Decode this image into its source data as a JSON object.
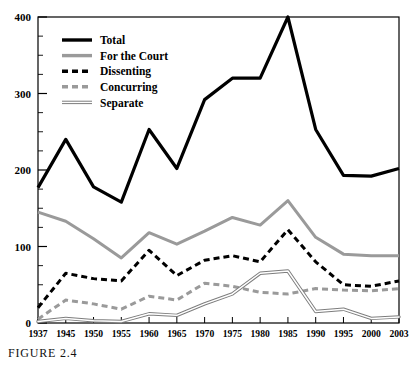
{
  "caption": "FIGURE 2.4",
  "legend": {
    "position": "top-left-inside",
    "entries": [
      {
        "label": "Total",
        "style": "solid-thick-black",
        "color": "#000000"
      },
      {
        "label": "For the Court",
        "style": "solid-thick-gray",
        "color": "#9a9a9a"
      },
      {
        "label": "Dissenting",
        "style": "dashed-thick-black",
        "color": "#000000"
      },
      {
        "label": "Concurring",
        "style": "dashed-thick-gray",
        "color": "#9a9a9a"
      },
      {
        "label": "Separate",
        "style": "double-thin-gray",
        "color": "#7d7d7d"
      }
    ]
  },
  "axes": {
    "y_tick_labels": [
      "400",
      "300",
      "200",
      "100",
      "0"
    ],
    "y_tick_values": [
      400,
      300,
      200,
      100,
      0
    ],
    "y_minor_step": 25,
    "x_tick_labels": [
      "1937",
      "1945",
      "1950",
      "1955",
      "1960",
      "1965",
      "1970",
      "1975",
      "1980",
      "1985",
      "1990",
      "1995",
      "2000",
      "2003"
    ]
  },
  "chart_data": {
    "type": "line",
    "title": "",
    "subtitle": "",
    "xlabel": "",
    "ylabel": "",
    "xlim": [
      0,
      13
    ],
    "ylim": [
      0,
      400
    ],
    "grid": false,
    "legend_position": "upper left (inside plot)",
    "categories": [
      "1937",
      "1945",
      "1950",
      "1955",
      "1960",
      "1965",
      "1970",
      "1975",
      "1980",
      "1985",
      "1990",
      "1995",
      "2000",
      "2003"
    ],
    "series": [
      {
        "name": "Total",
        "color": "#000000",
        "values": [
          177,
          240,
          178,
          158,
          253,
          202,
          292,
          320,
          320,
          400,
          253,
          193,
          192,
          202
        ]
      },
      {
        "name": "For the Court",
        "color": "#9a9a9a",
        "values": [
          145,
          133,
          110,
          85,
          118,
          103,
          120,
          138,
          128,
          160,
          112,
          90,
          88,
          88
        ]
      },
      {
        "name": "Dissenting",
        "color": "#000000",
        "values": [
          20,
          65,
          58,
          55,
          95,
          62,
          82,
          88,
          80,
          122,
          80,
          50,
          48,
          55
        ]
      },
      {
        "name": "Concurring",
        "color": "#9a9a9a",
        "values": [
          5,
          30,
          25,
          18,
          35,
          30,
          52,
          48,
          40,
          38,
          45,
          43,
          42,
          45
        ]
      },
      {
        "name": "Separate",
        "color": "#7d7d7d",
        "values": [
          2,
          6,
          3,
          2,
          12,
          10,
          25,
          38,
          65,
          68,
          15,
          18,
          6,
          8
        ]
      }
    ]
  }
}
